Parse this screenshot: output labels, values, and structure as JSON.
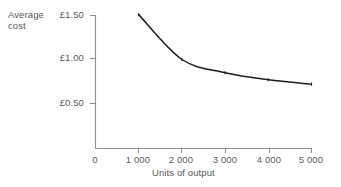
{
  "chart_data": {
    "type": "line",
    "title": "",
    "subtitle": "",
    "xlabel": "Units of output",
    "ylabel": "Average cost",
    "ylabel_line1": "Average",
    "ylabel_line2": "cost",
    "x": [
      1000,
      2000,
      3000,
      4000,
      5000
    ],
    "values": [
      1.51,
      1.0,
      0.85,
      0.77,
      0.72
    ],
    "series": [
      {
        "name": "Average cost",
        "values": [
          1.51,
          1.0,
          0.85,
          0.77,
          0.72
        ]
      }
    ],
    "xlim": [
      0,
      5000
    ],
    "ylim": [
      0,
      1.5
    ],
    "xticks": [
      0,
      1000,
      2000,
      3000,
      4000,
      5000
    ],
    "xticklabels": [
      "0",
      "1 000",
      "2 000",
      "3 000",
      "4 000",
      "5 000"
    ],
    "yticks": [
      0.5,
      1.0,
      1.5
    ],
    "yticklabels": [
      "£0.50",
      "£1.00",
      "£1.50"
    ],
    "grid": false,
    "legend": false,
    "legend_position": "none",
    "annotations": [],
    "currency_symbol": "£",
    "colors": {
      "curve": "#1c1c1c",
      "axis": "#8c8c8c",
      "text": "#5a5a5a",
      "background": "#ffffff"
    }
  },
  "axes": {
    "y_label_line1": "Average",
    "y_label_line2": "cost",
    "y_ticks": [
      {
        "label": "£1.50",
        "value": 1.5
      },
      {
        "label": "£1.00",
        "value": 1.0
      },
      {
        "label": "£0.50",
        "value": 0.5
      }
    ],
    "x_ticks": [
      {
        "label": "0",
        "value": 0
      },
      {
        "label": "1 000",
        "value": 1000
      },
      {
        "label": "2 000",
        "value": 2000
      },
      {
        "label": "3 000",
        "value": 3000
      },
      {
        "label": "4 000",
        "value": 4000
      },
      {
        "label": "5 000",
        "value": 5000
      }
    ],
    "x_label": "Units of output"
  }
}
